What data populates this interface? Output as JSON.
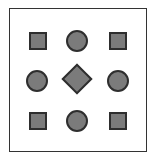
{
  "diagram": {
    "frame": {
      "border_color": "#333333"
    },
    "fill_color": "#7b7b7b",
    "stroke_color": "#2e2e2e",
    "grid": [
      [
        {
          "shape": "square"
        },
        {
          "shape": "circle"
        },
        {
          "shape": "square"
        }
      ],
      [
        {
          "shape": "circle"
        },
        {
          "shape": "diamond"
        },
        {
          "shape": "circle"
        }
      ],
      [
        {
          "shape": "square"
        },
        {
          "shape": "circle"
        },
        {
          "shape": "square"
        }
      ]
    ]
  }
}
